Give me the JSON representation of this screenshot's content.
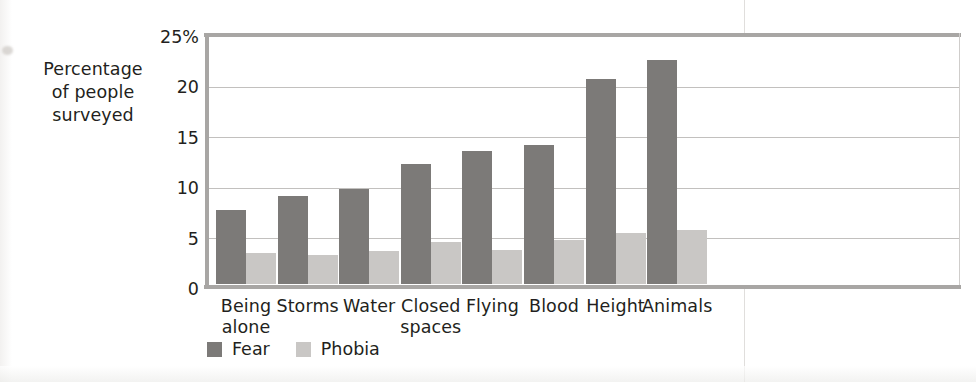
{
  "y_axis_title": "Percentage\nof people\nsurveyed",
  "legend": {
    "items": [
      {
        "label": "Fear",
        "color": "#7c7a78",
        "swatch": "legend-swatch-fear"
      },
      {
        "label": "Phobia",
        "color": "#c9c7c5",
        "swatch": "legend-swatch-phobia"
      }
    ]
  },
  "chart_data": {
    "type": "bar",
    "title": "",
    "xlabel": "",
    "ylabel": "Percentage of people surveyed",
    "ylim": [
      0,
      25
    ],
    "yticks": [
      "0",
      "5",
      "10",
      "15",
      "20",
      "25%"
    ],
    "ytick_values": [
      0,
      5,
      10,
      15,
      20,
      25
    ],
    "grid": true,
    "grid_axis": "y",
    "legend_position": "bottom-left",
    "categories": [
      "Being alone",
      "Storms",
      "Water",
      "Closed spaces",
      "Flying",
      "Blood",
      "Height",
      "Animals"
    ],
    "category_lines": [
      [
        "Being",
        "alone"
      ],
      [
        "Storms"
      ],
      [
        "Water"
      ],
      [
        "Closed",
        "spaces"
      ],
      [
        "Flying"
      ],
      [
        "Blood"
      ],
      [
        "Height"
      ],
      [
        "Animals"
      ]
    ],
    "series": [
      {
        "name": "Fear",
        "color": "#7c7a78",
        "values": [
          7.3,
          8.7,
          9.4,
          11.9,
          13.2,
          13.8,
          20.3,
          22.2
        ]
      },
      {
        "name": "Phobia",
        "color": "#c9c7c5",
        "values": [
          3.1,
          2.9,
          3.3,
          4.2,
          3.4,
          4.4,
          5.1,
          5.4
        ]
      }
    ]
  }
}
